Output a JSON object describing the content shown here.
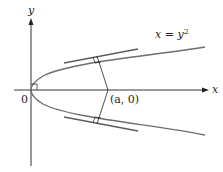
{
  "diagram": {
    "axes": {
      "x_label": "x",
      "y_label": "y",
      "origin_label": "0"
    },
    "curve": {
      "equation_lhs": "x = y",
      "equation_exp": "2"
    },
    "point": {
      "label": "(a, 0)"
    },
    "colors": {
      "axis": "#231f20",
      "curve": "#6d6e71",
      "tangent": "#5b5c5e",
      "normal": "#231f20"
    }
  }
}
